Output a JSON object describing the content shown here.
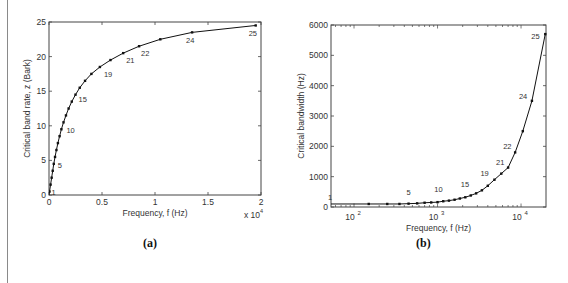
{
  "captions": {
    "a": "(a)",
    "b": "(b)"
  },
  "chart_data": [
    {
      "id": "a",
      "type": "line",
      "title": "",
      "xlabel": "Frequency, f (Hz)",
      "ylabel": "Critical band rate, z  (Bark)",
      "x_multiplier_label": "x 10",
      "x_multiplier_exp": "4",
      "xlim": [
        0,
        20000
      ],
      "ylim": [
        0,
        25
      ],
      "xticks": [
        0,
        5000,
        10000,
        15000,
        20000
      ],
      "xtick_labels": [
        "0",
        "0.5",
        "1",
        "1.5",
        "2"
      ],
      "yticks": [
        0,
        5,
        10,
        15,
        20,
        25
      ],
      "ytick_labels": [
        "0",
        "5",
        "10",
        "15",
        "20",
        "25"
      ],
      "grid": false,
      "x": [
        50,
        150,
        250,
        350,
        450,
        570,
        700,
        840,
        1000,
        1170,
        1370,
        1600,
        1850,
        2150,
        2500,
        2900,
        3400,
        4000,
        4800,
        5800,
        7000,
        8500,
        10500,
        13500,
        19500
      ],
      "y": [
        0.5,
        1.5,
        2.5,
        3.5,
        4.5,
        5.5,
        6.5,
        7.5,
        8.5,
        9.5,
        10.5,
        11.5,
        12.5,
        13.5,
        14.5,
        15.5,
        16.5,
        17.5,
        18.5,
        19.5,
        20.5,
        21.5,
        22.5,
        23.5,
        24.5
      ],
      "annotations": [
        {
          "text": "1",
          "band": 1
        },
        {
          "text": "5",
          "band": 5
        },
        {
          "text": "10",
          "band": 10
        },
        {
          "text": "15",
          "band": 15
        },
        {
          "text": "19",
          "band": 19
        },
        {
          "text": "21",
          "band": 21
        },
        {
          "text": "22",
          "band": 22
        },
        {
          "text": "24",
          "band": 24
        },
        {
          "text": "25",
          "band": 25
        }
      ]
    },
    {
      "id": "b",
      "type": "line",
      "title": "",
      "xlabel": "Frequency, f (Hz)",
      "ylabel": "Critical bandwidth  (Hz)",
      "xscale": "log",
      "xlim": [
        53,
        19900
      ],
      "ylim": [
        0,
        6000
      ],
      "xticks": [
        100,
        1000,
        10000
      ],
      "xtick_labels": [
        "10",
        "10",
        "10"
      ],
      "xtick_exps": [
        "2",
        "3",
        "4"
      ],
      "yticks": [
        0,
        1000,
        2000,
        3000,
        4000,
        5000,
        6000
      ],
      "ytick_labels": [
        "0",
        "1000",
        "2000",
        "3000",
        "4000",
        "5000",
        "6000"
      ],
      "grid": false,
      "x": [
        50,
        150,
        250,
        350,
        450,
        570,
        700,
        840,
        1000,
        1170,
        1370,
        1600,
        1850,
        2150,
        2500,
        2900,
        3400,
        4000,
        4800,
        5800,
        7000,
        8500,
        10500,
        13500,
        19500
      ],
      "y": [
        100,
        100,
        100,
        100,
        110,
        120,
        140,
        150,
        160,
        190,
        210,
        240,
        280,
        320,
        380,
        450,
        550,
        700,
        900,
        1100,
        1300,
        1800,
        2500,
        3500,
        5700
      ],
      "annotations": [
        {
          "text": "1",
          "band": 1
        },
        {
          "text": "5",
          "band": 5
        },
        {
          "text": "10",
          "band": 10
        },
        {
          "text": "15",
          "band": 15
        },
        {
          "text": "19",
          "band": 19
        },
        {
          "text": "21",
          "band": 21
        },
        {
          "text": "22",
          "band": 22
        },
        {
          "text": "24",
          "band": 24
        },
        {
          "text": "25",
          "band": 25
        }
      ]
    }
  ]
}
